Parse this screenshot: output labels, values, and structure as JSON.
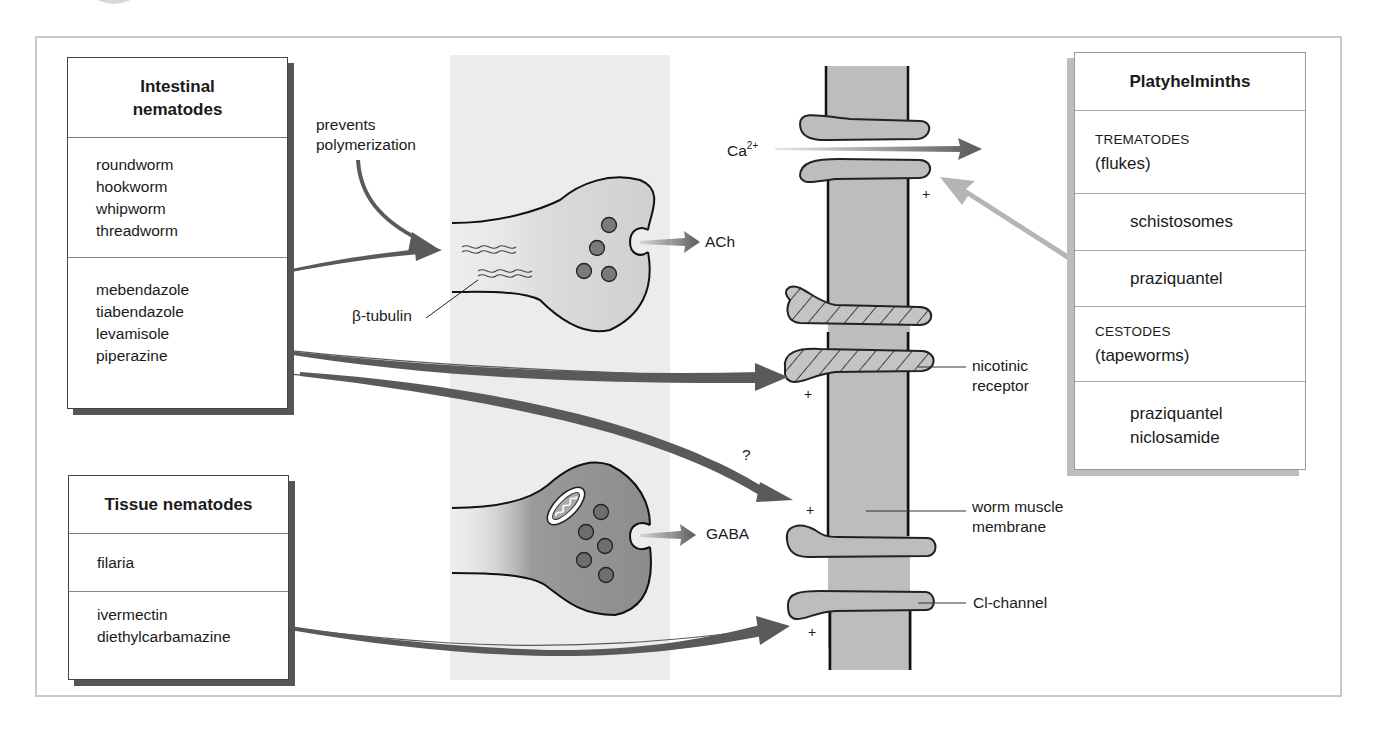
{
  "intestinal_nematodes": {
    "title_line1": "Intestinal",
    "title_line2": "nematodes",
    "organisms": [
      "roundworm",
      "hookworm",
      "whipworm",
      "threadworm"
    ],
    "drugs": [
      "mebendazole",
      "tiabendazole",
      "levamisole",
      "piperazine"
    ]
  },
  "tissue_nematodes": {
    "title": "Tissue nematodes",
    "organisms": [
      "filaria"
    ],
    "drugs": [
      "ivermectin",
      "diethylcarbamazine"
    ]
  },
  "platyhelminths": {
    "title": "Platyhelminths",
    "trematodes": {
      "class_label": "TREMATODES",
      "common_name": "(flukes)"
    },
    "trematode_organisms": [
      "schistosomes"
    ],
    "trematode_drugs": [
      "praziquantel"
    ],
    "cestodes": {
      "class_label": "CESTODES",
      "common_name": "(tapeworms)"
    },
    "cestode_drugs": [
      "praziquantel",
      "niclosamide"
    ]
  },
  "annotations": {
    "prevents_line1": "prevents",
    "prevents_line2": "polymerization",
    "beta_tubulin": "β-tubulin",
    "ach": "ACh",
    "gaba": "GABA",
    "calcium_base": "Ca",
    "calcium_charge": "2+",
    "question_mark": "?",
    "nicotinic_line1": "nicotinic",
    "nicotinic_line2": "receptor",
    "membrane_line1": "worm muscle",
    "membrane_line2": "membrane",
    "cl_channel": "Cl-channel",
    "plus": "+"
  },
  "colors": {
    "arrow_dark": "#5a5a5a",
    "arrow_light": "#b5b5b5",
    "membrane_fill": "#bdbdbd",
    "panel_bg": "#ececec",
    "vesicle": "#7a7a7a"
  }
}
